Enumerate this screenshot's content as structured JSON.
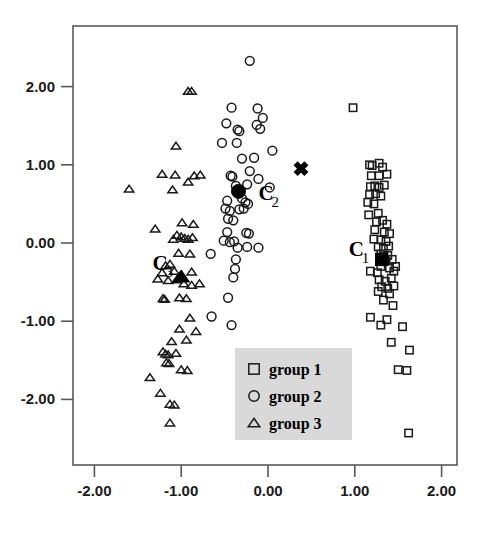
{
  "chart_data": {
    "type": "scatter",
    "title": "",
    "xlabel": "",
    "ylabel": "",
    "xlim": [
      -2.35,
      2.18
    ],
    "ylim": [
      -2.75,
      2.55
    ],
    "grid": false,
    "xticks": [
      "-2.00",
      "-1.00",
      "0.00",
      "1.00",
      "2.00"
    ],
    "xtickvalues": [
      -2,
      -1,
      0,
      1,
      2
    ],
    "yticks": [
      "2.00",
      "1.00",
      "0.00",
      "-1.00",
      "-2.00"
    ],
    "ytickvalues": [
      2,
      1,
      0,
      -1,
      -2
    ],
    "legend": {
      "position": "bottom-center",
      "entries": [
        {
          "marker": "square",
          "label": "group 1"
        },
        {
          "marker": "circle",
          "label": "group 2"
        },
        {
          "marker": "triangle",
          "label": "group 3"
        }
      ]
    },
    "series": [
      {
        "name": "group 1",
        "marker": "square",
        "filled": false,
        "points": [
          [
            0.98,
            1.73
          ],
          [
            1.17,
            1.0
          ],
          [
            1.2,
            0.99
          ],
          [
            1.28,
            1.02
          ],
          [
            1.32,
            0.97
          ],
          [
            1.19,
            0.86
          ],
          [
            1.28,
            0.86
          ],
          [
            1.37,
            0.88
          ],
          [
            1.18,
            0.72
          ],
          [
            1.23,
            0.73
          ],
          [
            1.28,
            0.71
          ],
          [
            1.34,
            0.74
          ],
          [
            1.17,
            0.62
          ],
          [
            1.24,
            0.63
          ],
          [
            1.3,
            0.6
          ],
          [
            1.15,
            0.52
          ],
          [
            1.22,
            0.5
          ],
          [
            1.16,
            0.36
          ],
          [
            1.27,
            0.38
          ],
          [
            1.25,
            0.27
          ],
          [
            1.32,
            0.29
          ],
          [
            1.37,
            0.24
          ],
          [
            1.23,
            0.17
          ],
          [
            1.34,
            0.14
          ],
          [
            1.4,
            0.12
          ],
          [
            1.22,
            0.05
          ],
          [
            1.3,
            0.04
          ],
          [
            1.36,
            0.02
          ],
          [
            1.27,
            -0.05
          ],
          [
            1.33,
            -0.07
          ],
          [
            1.39,
            -0.04
          ],
          [
            1.3,
            -0.14
          ],
          [
            1.38,
            -0.16
          ],
          [
            1.36,
            -0.23
          ],
          [
            1.43,
            -0.21
          ],
          [
            1.3,
            -0.3
          ],
          [
            1.4,
            -0.32
          ],
          [
            1.47,
            -0.3
          ],
          [
            1.18,
            -0.36
          ],
          [
            1.26,
            -0.38
          ],
          [
            1.45,
            -0.36
          ],
          [
            1.28,
            -0.47
          ],
          [
            1.35,
            -0.49
          ],
          [
            1.42,
            -0.45
          ],
          [
            1.31,
            -0.56
          ],
          [
            1.38,
            -0.58
          ],
          [
            1.45,
            -0.55
          ],
          [
            1.27,
            -0.62
          ],
          [
            1.4,
            -0.65
          ],
          [
            1.33,
            -0.73
          ],
          [
            1.44,
            -0.8
          ],
          [
            1.18,
            -0.95
          ],
          [
            1.37,
            -0.98
          ],
          [
            1.3,
            -1.05
          ],
          [
            1.55,
            -1.07
          ],
          [
            1.42,
            -1.27
          ],
          [
            1.63,
            -1.37
          ],
          [
            1.5,
            -1.62
          ],
          [
            1.6,
            -1.63
          ],
          [
            1.62,
            -2.43
          ]
        ]
      },
      {
        "name": "group 2",
        "marker": "circle",
        "filled": false,
        "points": [
          [
            -0.21,
            2.33
          ],
          [
            -0.42,
            1.73
          ],
          [
            -0.12,
            1.72
          ],
          [
            -0.48,
            1.53
          ],
          [
            -0.06,
            1.6
          ],
          [
            -0.35,
            1.45
          ],
          [
            -0.33,
            1.43
          ],
          [
            -0.13,
            1.51
          ],
          [
            -0.09,
            1.46
          ],
          [
            -0.53,
            1.28
          ],
          [
            -0.36,
            1.28
          ],
          [
            0.05,
            1.18
          ],
          [
            -0.3,
            1.08
          ],
          [
            -0.16,
            1.09
          ],
          [
            -0.43,
            0.86
          ],
          [
            -0.41,
            0.85
          ],
          [
            -0.21,
            0.92
          ],
          [
            -0.11,
            0.82
          ],
          [
            -0.37,
            0.73
          ],
          [
            -0.24,
            0.75
          ],
          [
            0.02,
            0.71
          ],
          [
            -0.3,
            0.57
          ],
          [
            -0.26,
            0.52
          ],
          [
            -0.23,
            0.5
          ],
          [
            -0.47,
            0.54
          ],
          [
            -0.49,
            0.44
          ],
          [
            -0.44,
            0.41
          ],
          [
            -0.33,
            0.43
          ],
          [
            -0.28,
            0.44
          ],
          [
            -0.46,
            0.31
          ],
          [
            -0.4,
            0.29
          ],
          [
            -0.47,
            0.14
          ],
          [
            -0.25,
            0.13
          ],
          [
            -0.22,
            0.12
          ],
          [
            -0.51,
            0.03
          ],
          [
            -0.44,
            0.01
          ],
          [
            -0.39,
            0.02
          ],
          [
            -0.66,
            -0.14
          ],
          [
            -0.35,
            -0.06
          ],
          [
            -0.24,
            -0.05
          ],
          [
            -0.11,
            -0.06
          ],
          [
            -0.37,
            -0.21
          ],
          [
            -0.38,
            -0.33
          ],
          [
            -0.4,
            -0.44
          ],
          [
            -0.46,
            -0.7
          ],
          [
            -0.65,
            -0.94
          ],
          [
            -0.42,
            -1.05
          ]
        ]
      },
      {
        "name": "group 3",
        "marker": "triangle",
        "filled": false,
        "points": [
          [
            -0.92,
            1.94
          ],
          [
            -0.88,
            1.94
          ],
          [
            -1.06,
            1.24
          ],
          [
            -1.22,
            0.88
          ],
          [
            -1.07,
            0.87
          ],
          [
            -0.85,
            0.86
          ],
          [
            -0.78,
            0.87
          ],
          [
            -1.6,
            0.69
          ],
          [
            -1.1,
            0.68
          ],
          [
            -0.92,
            0.78
          ],
          [
            -1.3,
            0.18
          ],
          [
            -0.99,
            0.26
          ],
          [
            -0.86,
            0.24
          ],
          [
            -1.05,
            0.1
          ],
          [
            -1.0,
            0.08
          ],
          [
            -0.96,
            0.06
          ],
          [
            -1.09,
            0.05
          ],
          [
            -0.92,
            0.05
          ],
          [
            -0.87,
            0.07
          ],
          [
            -1.03,
            -0.13
          ],
          [
            -0.9,
            -0.14
          ],
          [
            -1.13,
            -0.27
          ],
          [
            -1.18,
            -0.29
          ],
          [
            -1.22,
            -0.38
          ],
          [
            -1.08,
            -0.36
          ],
          [
            -0.88,
            -0.37
          ],
          [
            -1.15,
            -0.48
          ],
          [
            -1.05,
            -0.47
          ],
          [
            -1.27,
            -0.46
          ],
          [
            -0.97,
            -0.52
          ],
          [
            -0.88,
            -0.54
          ],
          [
            -0.79,
            -0.52
          ],
          [
            -1.21,
            -0.71
          ],
          [
            -1.19,
            -0.72
          ],
          [
            -1.02,
            -0.7
          ],
          [
            -0.94,
            -0.71
          ],
          [
            -0.9,
            -0.96
          ],
          [
            -1.02,
            -1.1
          ],
          [
            -0.83,
            -1.13
          ],
          [
            -1.11,
            -1.26
          ],
          [
            -0.94,
            -1.24
          ],
          [
            -1.18,
            -1.42
          ],
          [
            -1.15,
            -1.43
          ],
          [
            -1.06,
            -1.41
          ],
          [
            -1.21,
            -1.39
          ],
          [
            -1.17,
            -1.53
          ],
          [
            -1.14,
            -1.54
          ],
          [
            -1.0,
            -1.62
          ],
          [
            -0.93,
            -1.63
          ],
          [
            -1.36,
            -1.72
          ],
          [
            -1.24,
            -1.92
          ],
          [
            -1.13,
            -2.06
          ],
          [
            -1.08,
            -2.07
          ],
          [
            -1.13,
            -2.3
          ]
        ]
      }
    ],
    "centroids": [
      {
        "id": "C1",
        "label_main": "C",
        "label_sub": "1",
        "marker": "square",
        "x": 1.31,
        "y": -0.21,
        "label_x": 0.93,
        "label_y": -0.16
      },
      {
        "id": "C2",
        "label_main": "C",
        "label_sub": "2",
        "marker": "circle",
        "x": -0.34,
        "y": 0.66,
        "label_x": -0.11,
        "label_y": 0.55
      },
      {
        "id": "C3",
        "label_main": "C",
        "label_sub": "3",
        "marker": "triangle",
        "x": -1.0,
        "y": -0.43,
        "label_x": -1.33,
        "label_y": -0.34
      }
    ],
    "extra_markers": [
      {
        "name": "x-marker",
        "symbol": "x",
        "x": 0.38,
        "y": 0.95
      }
    ],
    "colors": {
      "marker_stroke": "#1a1a1a",
      "marker_fill": "#000000",
      "axis": "#595959",
      "legend_background": "#d9d9d9",
      "text": "#000000"
    }
  }
}
